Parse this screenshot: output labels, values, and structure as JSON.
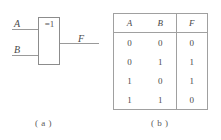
{
  "figure": {
    "caption_a": "( a )",
    "caption_b": "( b )"
  },
  "circuit": {
    "gate_symbol": "=1",
    "gate_type": "xor-gate",
    "input_a_label": "A",
    "input_b_label": "B",
    "output_label": "F",
    "line_color": "#9a9a9a",
    "box_color": "#8c8c8c"
  },
  "truth_table": {
    "headers": [
      "A",
      "B",
      "F"
    ],
    "rows": [
      [
        "0",
        "0",
        "0"
      ],
      [
        "0",
        "1",
        "1"
      ],
      [
        "1",
        "0",
        "1"
      ],
      [
        "1",
        "1",
        "0"
      ]
    ],
    "border_color": "#a0a0a0"
  }
}
